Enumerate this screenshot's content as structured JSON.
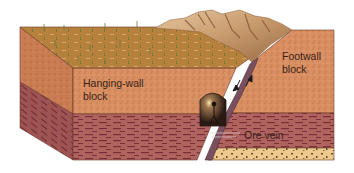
{
  "diagram": {
    "labels": {
      "hanging_wall_line1": "Hanging-wall",
      "hanging_wall_line2": "block",
      "footwall_line1": "Footwall",
      "footwall_line2": "block",
      "ore_vein": "Ore vein"
    },
    "colors": {
      "surface_grass": "#b5813c",
      "mountain_light": "#d9b48c",
      "mountain_dark": "#8c5a34",
      "rock_orange": "#d98f62",
      "rock_orange_side": "#c97b52",
      "strata_red": "#b06460",
      "strata_red_side": "#9e5452",
      "strata_dash": "#7a2e36",
      "ore_tan": "#ecc98e",
      "ore_speck": "#6b4a22",
      "fault_line": "#5c3a46",
      "text": "#3a2418"
    }
  }
}
